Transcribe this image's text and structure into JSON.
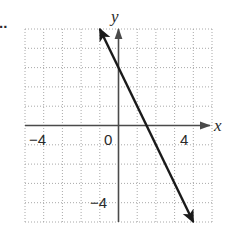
{
  "chart_data": {
    "type": "line",
    "title": "",
    "xlabel": "x",
    "ylabel": "y",
    "xlim": [
      -5,
      5
    ],
    "ylim": [
      -5,
      5
    ],
    "grid": true,
    "grid_step": 1,
    "x_tick_labels": [
      {
        "value": -4,
        "label": "−4"
      },
      {
        "value": 0,
        "label": "0"
      },
      {
        "value": 4,
        "label": "4"
      }
    ],
    "y_tick_labels": [
      {
        "value": -4,
        "label": "−4"
      }
    ],
    "series": [
      {
        "name": "line",
        "equation": "y = -2x + 3",
        "x": [
          -1,
          4
        ],
        "y": [
          5,
          -5
        ],
        "arrows_both_ends": true,
        "color": "#1a1a1a"
      }
    ],
    "legend": null,
    "annotations": [
      {
        "text": "..",
        "position": "top-left, partially cropped"
      }
    ]
  },
  "labels": {
    "x_axis": "x",
    "y_axis": "y",
    "x_tick_neg4": "−4",
    "x_tick_0": "0",
    "x_tick_4": "4",
    "y_tick_neg4": "−4",
    "corner_mark": ".."
  },
  "colors": {
    "grid": "#a8a8a8",
    "axis": "#4a4a4a",
    "line": "#1a1a1a",
    "text": "#2a2a2a",
    "background": "#ffffff"
  }
}
